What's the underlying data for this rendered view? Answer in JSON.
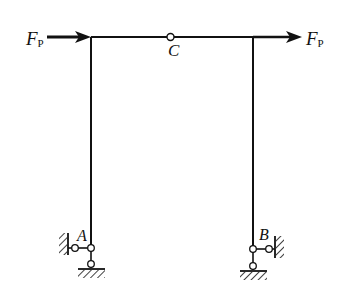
{
  "diagram": {
    "type": "structural-frame",
    "loads": [
      {
        "id": "load-left",
        "label_main": "F",
        "label_sub": "P",
        "direction": "right",
        "position": "left top corner"
      },
      {
        "id": "load-right",
        "label_main": "F",
        "label_sub": "P",
        "direction": "right",
        "position": "right top corner"
      }
    ],
    "nodes": [
      {
        "id": "C",
        "label": "C",
        "type": "hinge"
      },
      {
        "id": "A",
        "label": "A",
        "type": "fixed-pin support (two links)"
      },
      {
        "id": "B",
        "label": "B",
        "type": "fixed-pin support (two links)"
      }
    ],
    "colors": {
      "line": "#111111",
      "background": "#ffffff"
    }
  }
}
